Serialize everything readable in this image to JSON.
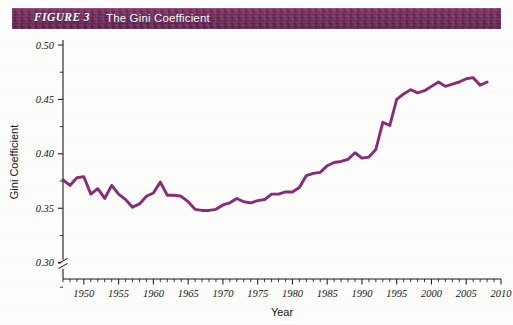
{
  "figure": {
    "label": "FIGURE 3",
    "title": "The Gini Coefficient"
  },
  "colors": {
    "header_bar": "#6e2457",
    "header_text": "#ffffff",
    "line": "#8a2b77",
    "axis": "#1b1b1b",
    "background": "#ffffff"
  },
  "chart_data": {
    "type": "line",
    "title": "The Gini Coefficient",
    "xlabel": "Year",
    "ylabel": "Gini Coefficient",
    "xlim": [
      1947,
      2010
    ],
    "ylim": [
      0.285,
      0.5
    ],
    "grid": false,
    "legend": null,
    "axis_break": {
      "axis": "y",
      "note": "double-slash break mark on y-axis below 0.30"
    },
    "ytick_labels": [
      "0.30",
      "0.35",
      "0.40",
      "0.45",
      "0.50"
    ],
    "ytick_values": [
      0.3,
      0.35,
      0.4,
      0.45,
      0.5
    ],
    "xtick_labels": [
      "1950",
      "1955",
      "1960",
      "1965",
      "1970",
      "1975",
      "1980",
      "1985",
      "1990",
      "1995",
      "2000",
      "2005",
      "2010"
    ],
    "xtick_values": [
      1950,
      1955,
      1960,
      1965,
      1970,
      1975,
      1980,
      1985,
      1990,
      1995,
      2000,
      2005,
      2010
    ],
    "xtick_minor_interval": 1,
    "series": [
      {
        "name": "Gini Coefficient",
        "color": "#8a2b77",
        "x": [
          1947,
          1948,
          1949,
          1950,
          1951,
          1952,
          1953,
          1954,
          1955,
          1956,
          1957,
          1958,
          1959,
          1960,
          1961,
          1962,
          1963,
          1964,
          1965,
          1966,
          1967,
          1968,
          1969,
          1970,
          1971,
          1972,
          1973,
          1974,
          1975,
          1976,
          1977,
          1978,
          1979,
          1980,
          1981,
          1982,
          1983,
          1984,
          1985,
          1986,
          1987,
          1988,
          1989,
          1990,
          1991,
          1992,
          1993,
          1994,
          1995,
          1996,
          1997,
          1998,
          1999,
          2000,
          2001,
          2002,
          2003,
          2004,
          2005,
          2006,
          2007,
          2008
        ],
        "values": [
          0.376,
          0.371,
          0.378,
          0.379,
          0.363,
          0.368,
          0.359,
          0.371,
          0.363,
          0.358,
          0.351,
          0.354,
          0.361,
          0.364,
          0.374,
          0.362,
          0.362,
          0.361,
          0.356,
          0.349,
          0.348,
          0.348,
          0.349,
          0.353,
          0.355,
          0.359,
          0.356,
          0.355,
          0.357,
          0.358,
          0.363,
          0.363,
          0.365,
          0.365,
          0.369,
          0.38,
          0.382,
          0.383,
          0.389,
          0.392,
          0.393,
          0.395,
          0.401,
          0.396,
          0.397,
          0.404,
          0.429,
          0.426,
          0.45,
          0.455,
          0.459,
          0.456,
          0.458,
          0.462,
          0.466,
          0.462,
          0.464,
          0.466,
          0.469,
          0.47,
          0.463,
          0.466
        ]
      }
    ]
  }
}
